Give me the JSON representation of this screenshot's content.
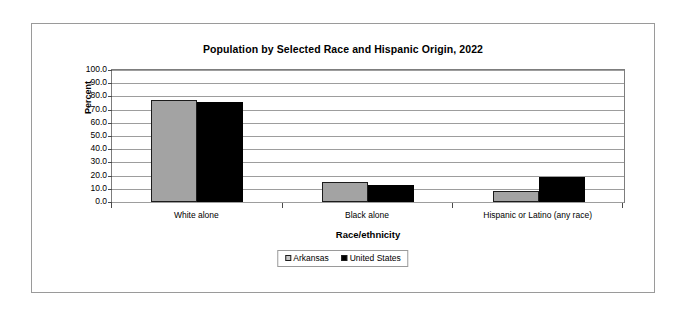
{
  "chart_data": {
    "type": "bar",
    "title": "Population by Selected Race and Hispanic Origin, 2022",
    "xlabel": "Race/ethnicity",
    "ylabel": "Percent",
    "categories": [
      "White alone",
      "Black alone",
      "Hispanic or Latino (any race)"
    ],
    "series": [
      {
        "name": "Arkansas",
        "color": "#a3a3a3",
        "values": [
          77.0,
          15.5,
          8.7
        ]
      },
      {
        "name": "United States",
        "color": "#000000",
        "values": [
          75.5,
          13.0,
          19.1
        ]
      }
    ],
    "ylim": [
      0,
      100
    ],
    "yticks": [
      "0.0",
      "10.0",
      "20.0",
      "30.0",
      "40.0",
      "50.0",
      "60.0",
      "70.0",
      "80.0",
      "90.0",
      "100.0"
    ],
    "grid": true,
    "legend_position": "bottom"
  }
}
